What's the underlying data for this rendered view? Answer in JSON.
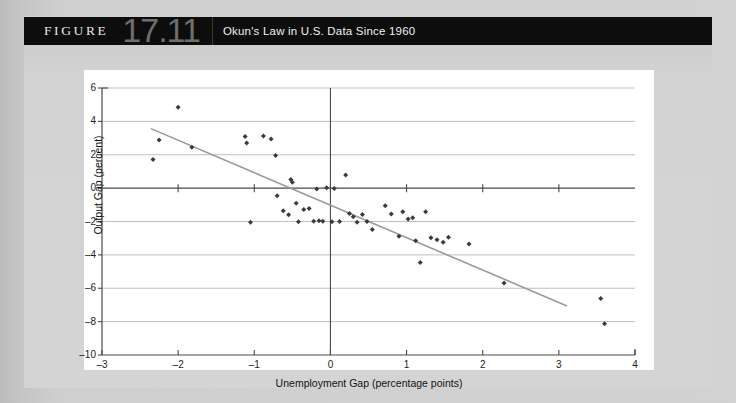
{
  "figure": {
    "label": "FIGURE",
    "number": "17.11",
    "caption": "Okun's Law in U.S. Data Since 1960"
  },
  "colors": {
    "header_bg": "#0d0d0d",
    "header_text": "#f0f0f0",
    "number_text": "#6e6e6e",
    "panel_bg": "#ffffff",
    "page_bg": "#d2d2d2",
    "gridline": "#b8b8b8",
    "axis": "#4a4a4a",
    "point": "#3b3b3b",
    "trendline": "#9a9a9a"
  },
  "chart_data": {
    "type": "scatter",
    "title": "Okun's Law in U.S. Data Since 1960",
    "xlabel": "Unemployment Gap (percentage points)",
    "ylabel": "Output Gap (percent)",
    "xlim": [
      -3,
      4
    ],
    "ylim": [
      -10,
      6
    ],
    "xticks": [
      -3,
      -2,
      -1,
      0,
      1,
      2,
      3,
      4
    ],
    "xticklabels": [
      "–3",
      "–2",
      "–1",
      "0",
      "1",
      "2",
      "3",
      "4"
    ],
    "yticks": [
      6,
      4,
      2,
      0,
      -2,
      -4,
      -6,
      -8,
      -10
    ],
    "yticklabels": [
      "6",
      "4",
      "2",
      "0",
      "–2",
      "–4",
      "–6",
      "–8",
      "–10"
    ],
    "grid": "horizontal",
    "legend": null,
    "series": [
      {
        "name": "U.S. annual observations since 1960",
        "marker": "diamond",
        "points": [
          [
            -2.33,
            1.72
          ],
          [
            -2.25,
            2.88
          ],
          [
            -2.0,
            4.85
          ],
          [
            -1.82,
            2.45
          ],
          [
            -1.12,
            3.1
          ],
          [
            -1.1,
            2.7
          ],
          [
            -1.05,
            -2.05
          ],
          [
            -0.88,
            3.12
          ],
          [
            -0.78,
            2.95
          ],
          [
            -0.72,
            1.95
          ],
          [
            -0.7,
            -0.45
          ],
          [
            -0.62,
            -1.35
          ],
          [
            -0.55,
            -1.6
          ],
          [
            -0.52,
            0.52
          ],
          [
            -0.5,
            0.35
          ],
          [
            -0.45,
            -0.9
          ],
          [
            -0.42,
            -2.02
          ],
          [
            -0.35,
            -1.28
          ],
          [
            -0.28,
            -1.22
          ],
          [
            -0.22,
            -1.98
          ],
          [
            -0.18,
            -0.05
          ],
          [
            -0.15,
            -1.95
          ],
          [
            -0.1,
            -1.98
          ],
          [
            -0.05,
            0.02
          ],
          [
            0.02,
            -2.02
          ],
          [
            0.05,
            -0.02
          ],
          [
            0.12,
            -2.0
          ],
          [
            0.2,
            0.78
          ],
          [
            0.25,
            -1.52
          ],
          [
            0.3,
            -1.72
          ],
          [
            0.35,
            -2.05
          ],
          [
            0.42,
            -1.58
          ],
          [
            0.48,
            -2.0
          ],
          [
            0.55,
            -2.48
          ],
          [
            0.72,
            -1.05
          ],
          [
            0.8,
            -1.55
          ],
          [
            0.9,
            -2.88
          ],
          [
            0.95,
            -1.42
          ],
          [
            1.02,
            -1.85
          ],
          [
            1.08,
            -1.78
          ],
          [
            1.12,
            -3.15
          ],
          [
            1.18,
            -4.45
          ],
          [
            1.25,
            -1.42
          ],
          [
            1.32,
            -2.98
          ],
          [
            1.4,
            -3.1
          ],
          [
            1.48,
            -3.25
          ],
          [
            1.55,
            -2.95
          ],
          [
            1.82,
            -3.35
          ],
          [
            2.28,
            -5.68
          ],
          [
            3.55,
            -6.62
          ],
          [
            3.6,
            -8.12
          ]
        ]
      }
    ],
    "trendline": {
      "name": "Okun's Law fitted line",
      "x": [
        -2.35,
        3.1
      ],
      "y": [
        3.55,
        -7.05
      ],
      "slope": -1.95,
      "intercept": -1.03
    }
  }
}
